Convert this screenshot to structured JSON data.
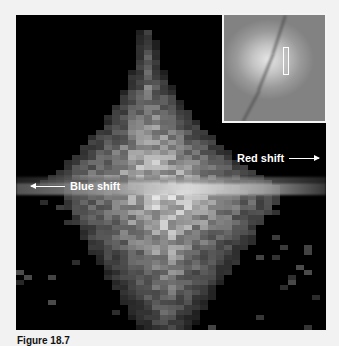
{
  "figure": {
    "labels": {
      "red_shift": "Red shift",
      "blue_shift": "Blue shift"
    },
    "caption": "Figure 18.7",
    "inset": {
      "description": "galaxy image with spectrograph slit marker"
    },
    "colors": {
      "background": "#000000",
      "page": "#f2f2f2",
      "label": "#ffffff"
    }
  }
}
